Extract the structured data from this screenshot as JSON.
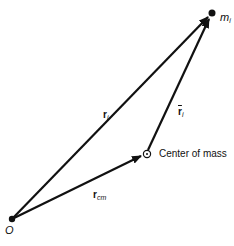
{
  "diagram": {
    "points": {
      "origin": {
        "label": "O",
        "x": 12,
        "y": 219
      },
      "mass": {
        "label": "m",
        "sub": "i",
        "x": 212,
        "y": 13
      },
      "center_of_mass": {
        "label": "Center of mass",
        "x": 146,
        "y": 154
      }
    },
    "vectors": {
      "r_i": {
        "label": "r",
        "sub": "i",
        "from": "origin",
        "to": "mass"
      },
      "r_cm": {
        "label": "r",
        "sub": "cm",
        "from": "origin",
        "to": "center_of_mass"
      },
      "r_bar_i": {
        "label": "r",
        "sub": "i",
        "from": "center_of_mass",
        "to": "mass"
      }
    },
    "colors": {
      "ink": "#111111",
      "background": "#ffffff"
    }
  }
}
